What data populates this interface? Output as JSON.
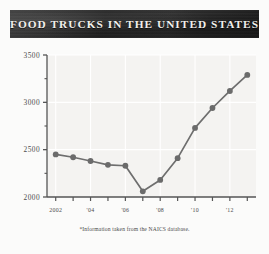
{
  "banner": {
    "title": "FOOD TRUCKS IN THE UNITED STATES"
  },
  "footnote": {
    "text": "*Information taken from the NAICS database."
  },
  "colors": {
    "banner_dark": "#232323",
    "banner_text": "#f2f0ec",
    "plot_background": "#f4f3f1",
    "gridline": "#ffffff",
    "axis": "#555555",
    "series_line": "#6e6e6e",
    "series_marker": "#6b6b6b",
    "tick_text": "#4c4c4c",
    "page_background": "#fbfbfa"
  },
  "chart_data": {
    "type": "line",
    "title": "FOOD TRUCKS IN THE UNITED STATES",
    "subtitle": "",
    "xlabel": "",
    "ylabel": "",
    "note": "*Information taken from the NAICS database.",
    "x": [
      2002,
      2003,
      2004,
      2005,
      2006,
      2007,
      2008,
      2009,
      2010,
      2011,
      2012,
      2013
    ],
    "values": [
      2450,
      2420,
      2380,
      2340,
      2330,
      2060,
      2180,
      2410,
      2730,
      2940,
      3120,
      3290
    ],
    "series": [
      {
        "name": "Food trucks",
        "values": [
          2450,
          2420,
          2380,
          2340,
          2330,
          2060,
          2180,
          2410,
          2730,
          2940,
          3120,
          3290
        ]
      }
    ],
    "xlim": [
      2001.5,
      2013.5
    ],
    "ylim": [
      2000,
      3500
    ],
    "y_ticks": [
      2000,
      2500,
      3000,
      3500
    ],
    "y_tick_labels": [
      "2000",
      "2500",
      "3000",
      "3500"
    ],
    "y_minor_ticks": [
      2250,
      2750,
      3250
    ],
    "x_ticks": [
      2002,
      2003,
      2004,
      2005,
      2006,
      2007,
      2008,
      2009,
      2010,
      2011,
      2012,
      2013
    ],
    "x_tick_labels": [
      "2002",
      "",
      "'04",
      "",
      "'06",
      "",
      "'08",
      "",
      "'10",
      "",
      "'12",
      ""
    ],
    "x_labeled": [
      {
        "x": 2002,
        "label": "2002"
      },
      {
        "x": 2004,
        "label": "'04"
      },
      {
        "x": 2006,
        "label": "'06"
      },
      {
        "x": 2008,
        "label": "'08"
      },
      {
        "x": 2010,
        "label": "'10"
      },
      {
        "x": 2012,
        "label": "'12"
      }
    ],
    "grid": true,
    "grid_color": "#ffffff",
    "legend": false,
    "legend_position": "none",
    "marker": "circle",
    "marker_size": 5
  }
}
